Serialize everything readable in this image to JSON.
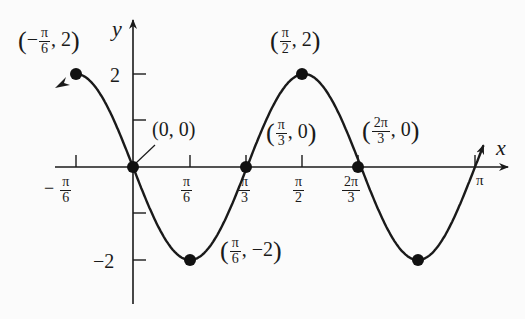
{
  "chart_data": {
    "type": "line",
    "function": "y = -2 sin(3x)",
    "xlabel": "x",
    "ylabel": "y",
    "x_ticks": [
      {
        "num": "π",
        "den": "6",
        "sign": "−",
        "value": -0.5236
      },
      {
        "num": "π",
        "den": "6",
        "sign": "",
        "value": 0.5236
      },
      {
        "num": "π",
        "den": "3",
        "sign": "",
        "value": 1.0472
      },
      {
        "num": "π",
        "den": "2",
        "sign": "",
        "value": 1.5708
      },
      {
        "num": "2π",
        "den": "3",
        "sign": "",
        "value": 2.0944
      },
      {
        "num": "π",
        "den": "",
        "sign": "",
        "value": 3.1416
      }
    ],
    "y_ticks": [
      {
        "label": "2",
        "value": 2
      },
      {
        "label": "",
        "value": 1
      },
      {
        "label": "",
        "value": -1
      },
      {
        "label": "−2",
        "value": -2
      }
    ],
    "points": [
      {
        "label": "(−π/6, 2)",
        "x": -0.5236,
        "y": 2
      },
      {
        "label": "(0, 0)",
        "x": 0,
        "y": 0
      },
      {
        "label": "(π/6, −2)",
        "x": 0.5236,
        "y": -2
      },
      {
        "label": "(π/3, 0)",
        "x": 1.0472,
        "y": 0
      },
      {
        "label": "(π/2, 2)",
        "x": 1.5708,
        "y": 2
      },
      {
        "label": "(2π/3, 0)",
        "x": 2.0944,
        "y": 0
      },
      {
        "label": "(5π/6, −2)",
        "x": 2.618,
        "y": -2
      }
    ],
    "xlim": [
      -0.7,
      3.3
    ],
    "ylim": [
      -2.4,
      2.6
    ],
    "grid": false,
    "legend": null
  },
  "labels": {
    "y_axis": "y",
    "x_axis": "x",
    "y_tick_2": "2",
    "y_tick_neg2": "−2",
    "neg": "−",
    "pi": "π",
    "two_pi": "2π",
    "d2": "2",
    "d3": "3",
    "d6": "6",
    "zero": "0",
    "two": "2",
    "neg_two": "−2",
    "comma": ",",
    "origin": "(0, 0)",
    "lp": "(",
    "rp": ")"
  }
}
